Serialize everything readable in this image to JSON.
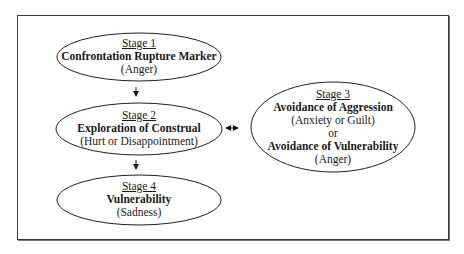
{
  "diagram": {
    "frame": {
      "stroke": "#3a3a3a",
      "background": "#ffffff"
    },
    "nodes": [
      {
        "id": "stage1",
        "stage": "Stage 1",
        "title": "Confrontation Rupture Marker",
        "emotion": "(Anger)",
        "shape": "ellipse",
        "cx": 139,
        "cy": 57,
        "rx": 82,
        "ry": 24
      },
      {
        "id": "stage2",
        "stage": "Stage 2",
        "title": "Exploration of Construal",
        "emotion": "(Hurt or Disappointment)",
        "shape": "ellipse",
        "cx": 139,
        "cy": 129,
        "rx": 83,
        "ry": 26
      },
      {
        "id": "stage3",
        "stage": "Stage 3",
        "title": "Avoidance of Aggression",
        "emotion": "(Anxiety or Guilt)",
        "connector": "or",
        "title2": "Avoidance of Vulnerability",
        "emotion2": "(Anger)",
        "shape": "ellipse",
        "cx": 333,
        "cy": 127,
        "rx": 82,
        "ry": 45
      },
      {
        "id": "stage4",
        "stage": "Stage 4",
        "title": "Vulnerability",
        "emotion": "(Sadness)",
        "shape": "ellipse",
        "cx": 139,
        "cy": 200,
        "rx": 82,
        "ry": 25
      }
    ],
    "edges": [
      {
        "from": "stage1",
        "to": "stage2",
        "type": "arrow-down"
      },
      {
        "from": "stage2",
        "to": "stage4",
        "type": "arrow-down"
      },
      {
        "from": "stage2",
        "to": "stage3",
        "type": "bidirectional"
      }
    ]
  }
}
